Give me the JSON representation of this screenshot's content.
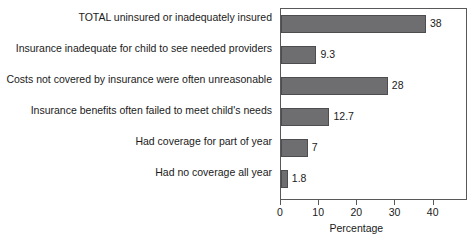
{
  "chart_data": {
    "type": "bar",
    "orientation": "horizontal",
    "title": "",
    "xlabel": "Percentage",
    "ylabel": "",
    "xlim": [
      0,
      49
    ],
    "ylim": null,
    "grid": false,
    "legend": null,
    "bar_color": "#6e6e70",
    "bar_edge_color": "#4d4d4f",
    "axis_color": "#58585a",
    "xticks": [
      0,
      10,
      20,
      30,
      40
    ],
    "xtick_labels": [
      "0",
      "10",
      "20",
      "30",
      "40"
    ],
    "categories": [
      "TOTAL uninsured or inadequately insured",
      "Insurance inadequate for child to see needed providers",
      "Costs not covered by insurance were often unreasonable",
      "Insurance benefits often failed to meet child's needs",
      "Had coverage for part of year",
      "Had no coverage all year"
    ],
    "values": [
      38,
      9.3,
      28,
      12.7,
      7,
      1.8
    ],
    "value_labels": [
      "38",
      "9.3",
      "28",
      "12.7",
      "7",
      "1.8"
    ]
  }
}
